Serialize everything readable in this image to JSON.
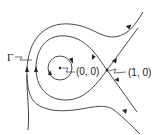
{
  "diagram": {
    "labels": {
      "center": "(0, 0)",
      "saddle": "(1, 0)",
      "homoclinic": "Γ"
    },
    "stroke_color": "#333333"
  }
}
